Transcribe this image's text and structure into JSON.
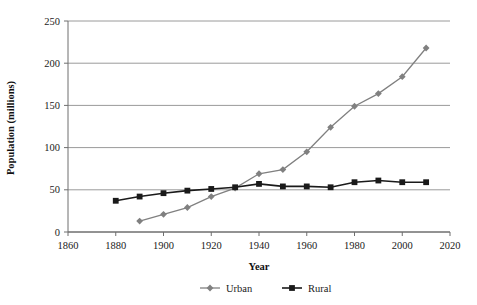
{
  "chart_data": {
    "type": "line",
    "title": "",
    "xlabel": "Year",
    "ylabel": "Population (millions)",
    "xlim": [
      1860,
      2020
    ],
    "ylim": [
      0,
      250
    ],
    "xticks": [
      1860,
      1880,
      1900,
      1920,
      1940,
      1960,
      1980,
      2000,
      2020
    ],
    "yticks": [
      0,
      50,
      100,
      150,
      200,
      250
    ],
    "grid": "horizontal",
    "legend_position": "bottom",
    "series": [
      {
        "name": "Urban",
        "color": "#808080",
        "marker": "diamond",
        "x": [
          1890,
          1900,
          1910,
          1920,
          1930,
          1940,
          1950,
          1960,
          1970,
          1980,
          1990,
          2000,
          2010
        ],
        "values": [
          13,
          21,
          29,
          42,
          52,
          69,
          74,
          95,
          124,
          149,
          164,
          184,
          218
        ]
      },
      {
        "name": "Rural",
        "color": "#1a1a1a",
        "marker": "square",
        "x": [
          1880,
          1890,
          1900,
          1910,
          1920,
          1930,
          1940,
          1950,
          1960,
          1970,
          1980,
          1990,
          2000,
          2010
        ],
        "values": [
          37,
          42,
          46,
          49,
          51,
          53,
          57,
          54,
          54,
          53,
          59,
          61,
          59,
          59
        ]
      }
    ]
  },
  "axis": {
    "y_title": "Population (millions)",
    "x_title": "Year",
    "ytick_labels": [
      "250",
      "200",
      "150",
      "100",
      "50",
      "0"
    ],
    "xtick_labels": [
      "1860",
      "1880",
      "1900",
      "1920",
      "1940",
      "1960",
      "1980",
      "2000",
      "2020"
    ]
  },
  "legend": {
    "items": [
      {
        "label": "Urban",
        "color": "#808080",
        "marker": "diamond"
      },
      {
        "label": "Rural",
        "color": "#1a1a1a",
        "marker": "square"
      }
    ]
  },
  "colors": {
    "urban": "#808080",
    "rural": "#1a1a1a",
    "grid": "#9a9a9a",
    "axis": "#6e6e6e",
    "background": "#ffffff"
  }
}
